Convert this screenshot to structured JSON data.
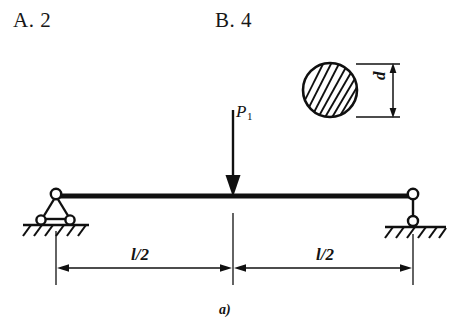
{
  "answers": {
    "option_a": "A. 2",
    "option_b": "B. 4"
  },
  "figure": {
    "caption": "a)",
    "load_label": "P",
    "load_subscript": "1",
    "diameter_label": "d",
    "span_left_label": "l/2",
    "span_right_label": "l/2",
    "stroke_color": "#101010",
    "background_color": "#ffffff",
    "elements": {
      "beam": "horizontal-beam",
      "left_support": "pin-support",
      "right_support": "roller-support",
      "load_arrow": "downward-point-load",
      "cross_section": "hatched-circular-section",
      "dimension_lines": "span-dimensions"
    }
  }
}
